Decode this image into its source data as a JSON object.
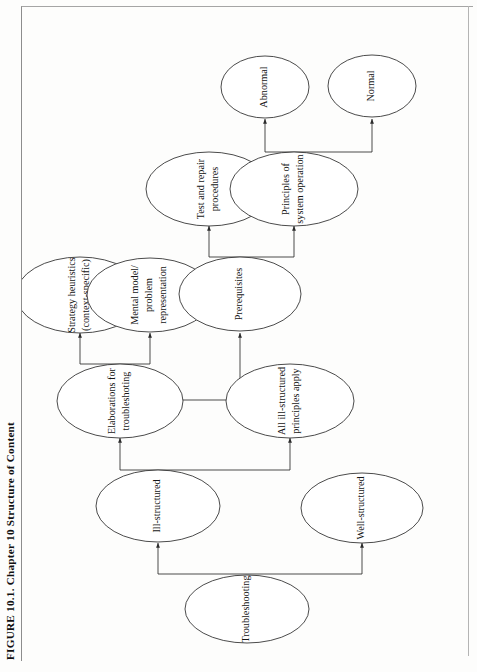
{
  "figure": {
    "caption": "FIGURE 10.1.  Chapter 10 Structure of Content",
    "type": "tree-diagram",
    "orientation": "rotated-90-ccw",
    "colors": {
      "stroke": "#2b2b2b",
      "node_fill": "#ffffff",
      "page": "#fdfdfc",
      "frame": "#8d8d8d"
    }
  },
  "nodes": {
    "troubleshooting": {
      "label": "Troubleshooting",
      "lines": [
        "Troubleshooting"
      ]
    },
    "well_structured": {
      "label": "Well-structured",
      "lines": [
        "Well-structured"
      ]
    },
    "ill_structured": {
      "label": "Ill-structured",
      "lines": [
        "Ill-structured"
      ]
    },
    "all_ill_structured": {
      "label": "All ill-structured principles apply",
      "lines": [
        "All ill-structured",
        "principles apply"
      ]
    },
    "elaborations": {
      "label": "Elaborations for troubleshooting",
      "lines": [
        "Elaborations for",
        "troubleshoting"
      ]
    },
    "strategy_heuristics": {
      "label": "Strategy heuristics (context-specific)",
      "lines": [
        "Strategy heuristics",
        "(context-specific)"
      ]
    },
    "mental_model": {
      "label": "Mental model/ problem representation",
      "lines": [
        "Mental model/",
        "problem",
        "representation"
      ]
    },
    "prerequisites": {
      "label": "Prerequisites",
      "lines": [
        "Prerequisites"
      ]
    },
    "test_repair": {
      "label": "Test and repair procedures",
      "lines": [
        "Test and repair",
        "procedures"
      ]
    },
    "principles": {
      "label": "Principles of system operation",
      "lines": [
        "Principles of",
        "system operation"
      ]
    },
    "abnormal": {
      "label": "Abnormal",
      "lines": [
        "Abnormal"
      ]
    },
    "normal": {
      "label": "Normal",
      "lines": [
        "Normal"
      ]
    }
  },
  "edges": [
    {
      "from": "troubleshooting",
      "to": "well_structured"
    },
    {
      "from": "troubleshooting",
      "to": "ill_structured"
    },
    {
      "from": "ill_structured",
      "to": "all_ill_structured"
    },
    {
      "from": "ill_structured",
      "to": "elaborations"
    },
    {
      "from": "elaborations",
      "to": "mental_model"
    },
    {
      "from": "elaborations",
      "to": "strategy_heuristics"
    },
    {
      "from": "mental_model",
      "to": "prerequisites"
    },
    {
      "from": "prerequisites",
      "to": "test_repair"
    },
    {
      "from": "prerequisites",
      "to": "principles"
    },
    {
      "from": "principles",
      "to": "abnormal"
    },
    {
      "from": "principles",
      "to": "normal"
    }
  ]
}
